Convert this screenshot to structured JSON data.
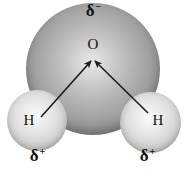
{
  "figure": {
    "labels": {
      "partial_negative": {
        "delta": "δ",
        "sign": "−"
      },
      "oxygen": "O",
      "hydrogen_left": "H",
      "hydrogen_right": "H",
      "partial_positive_left": {
        "delta": "δ",
        "sign": "+"
      },
      "partial_positive_right": {
        "delta": "δ",
        "sign": "+"
      }
    },
    "arrows": [
      {
        "name": "left-dipole-arrow",
        "from": "hydrogen-left",
        "to": "oxygen-center"
      },
      {
        "name": "right-dipole-arrow",
        "from": "hydrogen-right",
        "to": "oxygen-center"
      }
    ],
    "colors": {
      "background": "#ffffff",
      "oxygen_sphere_highlight": "#e9e9e9",
      "oxygen_sphere_mid": "#a0a0a0",
      "oxygen_sphere_edge": "#6d6d6d",
      "hydrogen_sphere_highlight": "#fbfbfb",
      "hydrogen_sphere_mid": "#cfcfcf",
      "hydrogen_sphere_edge": "#9e9e9e",
      "arrow": "#1c1c1c",
      "text": "#121212"
    }
  }
}
